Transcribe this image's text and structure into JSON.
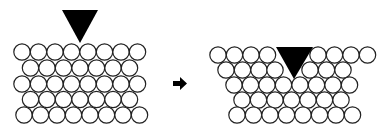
{
  "diagram": {
    "colors": {
      "atom_fill": "#ffffff",
      "atom_stroke": "#222222",
      "indenter": "#000000",
      "background": "#ffffff"
    },
    "atom_radius": 8.2,
    "panels": [
      {
        "name": "before",
        "indenter": {
          "points": "62,10 98,10 80,43"
        },
        "rows": [
          {
            "y": 52,
            "x": [
              22,
              38.5,
              55,
              71.5,
              88,
              104.5,
              121,
              137.5
            ]
          },
          {
            "y": 68,
            "x": [
              30.5,
              47,
              63.5,
              80,
              96.5,
              113,
              129.5
            ]
          },
          {
            "y": 84,
            "x": [
              22,
              38.5,
              55,
              71.5,
              88,
              104.5,
              121,
              137.5
            ]
          },
          {
            "y": 99.5,
            "x": [
              30.5,
              47,
              63.5,
              80,
              96.5,
              113,
              129.5
            ]
          },
          {
            "y": 115,
            "x": [
              24,
              40.5,
              57,
              73.5,
              90,
              106.5,
              123,
              139.5
            ]
          }
        ]
      },
      {
        "name": "after",
        "indenter": {
          "points": "276,47 313,47 294,79"
        },
        "rows": [
          {
            "y": 55,
            "x": [
              218,
              234.5,
              251,
              267.5,
              318,
              334.5,
              351,
              367.5
            ]
          },
          {
            "y": 70,
            "x": [
              226,
              242.5,
              259,
              275,
              310,
              326.5,
              343
            ]
          },
          {
            "y": 85,
            "x": [
              234,
              250.5,
              267,
              283.5,
              300,
              316.5,
              333,
              349.5
            ]
          },
          {
            "y": 100,
            "x": [
              242,
              258.5,
              275,
              291.5,
              308,
              324.5,
              341
            ]
          },
          {
            "y": 115,
            "x": [
              237,
              253.5,
              270,
              286.5,
              303,
              319.5,
              336,
              352.5
            ]
          }
        ]
      }
    ],
    "arrow": {
      "points": "173,81 180,81 180,77 187,83.5 180,90 180,86 173,86"
    }
  }
}
